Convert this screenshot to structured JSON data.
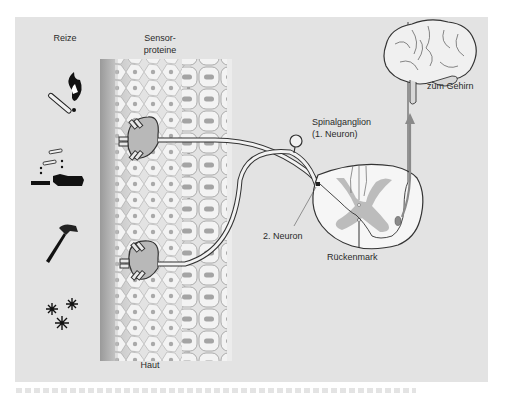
{
  "figure": {
    "background": "#e3e3e3",
    "labels": {
      "stimuli": "Reize",
      "sensor_proteins_line1": "Sensor-",
      "sensor_proteins_line2": "proteine",
      "skin": "Haut",
      "spinal_ganglion_line1": "Spinalganglion",
      "spinal_ganglion_line2": "(1. Neuron)",
      "second_neuron": "2. Neuron",
      "spinal_cord": "Rückenmark",
      "to_brain": "zum Gehirn"
    },
    "stimuli_icons": [
      {
        "name": "heat-match-flame",
        "meaning": "Hitze"
      },
      {
        "name": "acid-chemical",
        "meaning": "Chemikalien"
      },
      {
        "name": "hammer",
        "meaning": "Mechanisch"
      },
      {
        "name": "snowflakes",
        "meaning": "Kälte"
      }
    ],
    "colors": {
      "skin_cells": "#f2f2f2",
      "cell_nucleus": "#a9a9a9",
      "grey_matter": "#bdbdbd",
      "nerve_ending": "#b8b8b8",
      "ascending_tract": "#8a8a8a",
      "outline": "#333333"
    }
  }
}
